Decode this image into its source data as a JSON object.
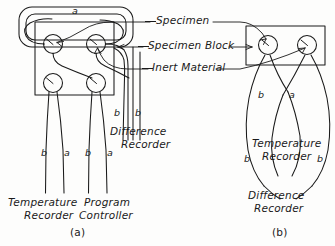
{
  "figure": {
    "panels": [
      {
        "id": "a",
        "caption": "(a)"
      },
      {
        "id": "b",
        "caption": "(b)"
      }
    ]
  },
  "callouts": {
    "specimen": "Specimen",
    "specimen_block": "Specimen Block",
    "inert_material": "Inert Material"
  },
  "panel_a": {
    "top_loop_label": "a",
    "wire_labels": [
      "b",
      "a",
      "b",
      "a",
      "b",
      "b"
    ],
    "devices": {
      "temperature_recorder_line1": "Temperature",
      "temperature_recorder_line2": "Recorder",
      "program_controller_line1": "Program",
      "program_controller_line2": "Controller",
      "difference_recorder_line1": "Difference",
      "difference_recorder_line2": "Recorder"
    },
    "caption": "(a)"
  },
  "panel_b": {
    "wire_labels": [
      "b",
      "a",
      "b",
      "b"
    ],
    "devices": {
      "temperature_recorder_line1": "Temperature",
      "temperature_recorder_line2": "Recorder",
      "difference_recorder_line1": "Difference",
      "difference_recorder_line2": "Recorder"
    },
    "caption": "(b)"
  },
  "colors": {
    "ink": "#1a1a1a",
    "paper": "#fdfdfc"
  }
}
